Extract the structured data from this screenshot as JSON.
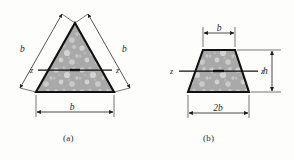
{
  "figure": {
    "background_color": "#fdfdfc",
    "line_color": "#1c1c1c",
    "fill_color": "#a8a8a8",
    "speckle_color": "#d8d8d8"
  },
  "panels": [
    {
      "caption": "(a)",
      "shape": "triangle",
      "shape_name": "equilateral-triangle-cross-section",
      "dimensions": [
        {
          "name": "left-side-length",
          "label": "b"
        },
        {
          "name": "right-side-length",
          "label": "b"
        },
        {
          "name": "base-width",
          "label": "b"
        }
      ],
      "axis": {
        "name": "centroidal-axis",
        "left_label": "z",
        "right_label": "z"
      }
    },
    {
      "caption": "(b)",
      "shape": "trapezoid",
      "shape_name": "trapezoid-cross-section",
      "dimensions": [
        {
          "name": "top-width",
          "label": "b"
        },
        {
          "name": "bottom-width",
          "label": "2b"
        },
        {
          "name": "height",
          "label": "h"
        }
      ],
      "axis": {
        "name": "centroidal-axis",
        "left_label": "z",
        "right_label": "z"
      }
    }
  ]
}
